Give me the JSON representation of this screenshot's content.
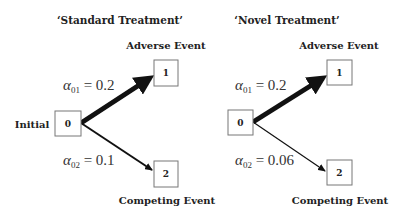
{
  "panels": [
    {
      "title": "‘Standard Treatment’",
      "initial_label": "Initial",
      "nodes": {
        "initial": "0",
        "adverse": "1",
        "competing": "2"
      },
      "adverse_label": "Adverse Event",
      "competing_label": "Competing Event",
      "transitions": [
        {
          "symbol": "α",
          "subscript": "01",
          "rest": " = 0.2",
          "value": 0.2
        },
        {
          "symbol": "α",
          "subscript": "02",
          "rest": " = 0.1",
          "value": 0.1
        }
      ]
    },
    {
      "title": "‘Novel Treatment’",
      "nodes": {
        "initial": "0",
        "adverse": "1",
        "competing": "2"
      },
      "adverse_label": "Adverse Event",
      "competing_label": "Competing Event",
      "transitions": [
        {
          "symbol": "α",
          "subscript": "01",
          "rest": " = 0.2",
          "value": 0.2
        },
        {
          "symbol": "α",
          "subscript": "02",
          "rest": " = 0.06",
          "value": 0.06
        }
      ]
    }
  ]
}
